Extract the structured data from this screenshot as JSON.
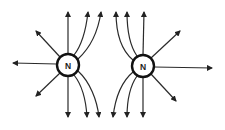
{
  "diagram": {
    "title": "",
    "poles": [
      {
        "label": "N",
        "cx": 68,
        "cy": 65,
        "r": 11
      },
      {
        "label": "N",
        "cx": 143,
        "cy": 66,
        "r": 11
      }
    ],
    "colors": {
      "line": "#2a2a2a",
      "pole_stroke": "#111111",
      "background": "#ffffff"
    }
  }
}
